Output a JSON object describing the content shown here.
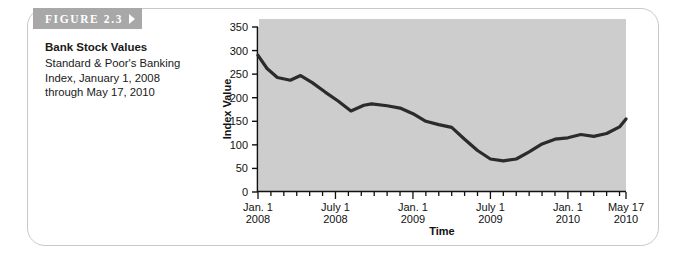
{
  "figure": {
    "banner_label": "FIGURE 2.3",
    "title": "Bank Stock Values",
    "caption_line1": "Standard & Poor's Banking",
    "caption_line2": "Index, January 1, 2008",
    "caption_line3": "through May 17, 2010"
  },
  "colors": {
    "plot_background": "#cdcdcd",
    "line": "#2b2b2b",
    "banner": "#a8a8a8",
    "card_border": "#c9c9c9",
    "axis": "#111111"
  },
  "chart_data": {
    "type": "line",
    "title": "Bank Stock Values",
    "subtitle": "Standard & Poor's Banking Index, January 1, 2008 through May 17, 2010",
    "xlabel": "Time",
    "ylabel": "Index Value",
    "ylim": [
      0,
      350
    ],
    "ytick_labels": [
      "0",
      "50",
      "100",
      "150",
      "200",
      "250",
      "300",
      "350"
    ],
    "ytick_values": [
      0,
      50,
      100,
      150,
      200,
      250,
      300,
      350
    ],
    "xtick_labels": [
      {
        "line1": "Jan. 1",
        "line2": "2008"
      },
      {
        "line1": "July 1",
        "line2": "2008"
      },
      {
        "line1": "Jan. 1",
        "line2": "2009"
      },
      {
        "line1": "July 1",
        "line2": "2009"
      },
      {
        "line1": "Jan. 1",
        "line2": "2010"
      },
      {
        "line1": "May 17",
        "line2": "2010"
      }
    ],
    "xtick_positions_months": [
      0,
      6,
      12,
      18,
      24,
      28.5
    ],
    "minor_ticks": "monthly",
    "grid": false,
    "legend": false,
    "x_unit": "months since January 1, 2008",
    "xlim_months": [
      0,
      28.5
    ],
    "series": [
      {
        "name": "S&P Banking Index",
        "x": [
          0,
          1,
          2,
          3,
          4,
          5,
          6,
          7,
          8,
          9,
          10,
          11,
          12,
          13,
          14,
          15,
          16,
          17,
          18,
          19,
          20,
          21,
          22,
          23,
          24,
          25,
          26,
          27,
          28.5
        ],
        "values": [
          290,
          255,
          240,
          237,
          247,
          228,
          210,
          193,
          170,
          187,
          186,
          182,
          172,
          158,
          143,
          137,
          110,
          88,
          68,
          66,
          78,
          96,
          113,
          118,
          128,
          125,
          131,
          130,
          127
        ]
      }
    ],
    "series_points_full": {
      "comment": "values read from the printed line graph at monthly resolution",
      "x_months": [
        0,
        0.7,
        1.5,
        2.5,
        3.3,
        4.2,
        5.2,
        6.2,
        7.2,
        8.2,
        8.8,
        10,
        11,
        12,
        13,
        14,
        15,
        16,
        17,
        18,
        19,
        20,
        21,
        22,
        23,
        24,
        25,
        26,
        27,
        28,
        28.5
      ],
      "y_values": [
        290,
        262,
        243,
        237,
        247,
        232,
        212,
        193,
        172,
        184,
        187,
        183,
        178,
        166,
        150,
        143,
        137,
        112,
        88,
        70,
        66,
        70,
        85,
        102,
        112,
        115,
        122,
        118,
        124,
        138,
        155
      ]
    }
  }
}
